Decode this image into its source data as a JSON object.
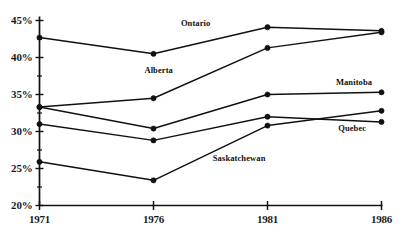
{
  "chart_data": {
    "type": "line",
    "title": "",
    "subtitle": "",
    "xlabel": "",
    "ylabel": "",
    "x": [
      1971,
      1976,
      1981,
      1986
    ],
    "categories": [
      "1971",
      "1976",
      "1981",
      "1986"
    ],
    "xtick_labels": [
      "1971",
      "1976",
      "1981",
      "1986"
    ],
    "ytick_labels": [
      "20%",
      "25%",
      "30%",
      "35%",
      "40%",
      "45%"
    ],
    "ytick_values": [
      20,
      25,
      30,
      35,
      40,
      45
    ],
    "ylim": [
      20,
      45
    ],
    "xlim": [
      1971,
      1986
    ],
    "grid": false,
    "legend_position": "inline-annotations",
    "minor_ticks": true,
    "marker": "filled-circle",
    "line_color": "#111111",
    "axis_color": "#111111",
    "background_color": "#ffffff",
    "series": [
      {
        "name": "Ontario",
        "label": "Ontario",
        "values": [
          42.7,
          40.5,
          44.1,
          43.6
        ],
        "label_x": 1977.2,
        "label_y": 44.6
      },
      {
        "name": "Alberta",
        "label": "Alberta",
        "values": [
          33.3,
          34.5,
          41.3,
          43.4
        ],
        "label_x": 1975.6,
        "label_y": 38.2
      },
      {
        "name": "Manitoba",
        "label": "Manitoba",
        "values": [
          33.3,
          30.4,
          35.0,
          35.3
        ],
        "label_x": 1984.0,
        "label_y": 36.6
      },
      {
        "name": "Quebec",
        "label": "Quebec",
        "values": [
          31.0,
          28.8,
          32.0,
          31.3
        ],
        "label_x": 1984.1,
        "label_y": 30.3
      },
      {
        "name": "Saskatchewan",
        "label": "Saskatchewan",
        "values": [
          25.9,
          23.4,
          30.8,
          32.8
        ],
        "label_x": 1978.6,
        "label_y": 26.3
      }
    ]
  }
}
